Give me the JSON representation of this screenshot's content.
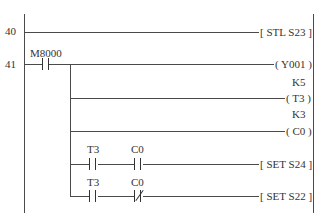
{
  "diagram": {
    "type": "PLC ladder diagram",
    "rungs": [
      {
        "step": "40",
        "elements": [],
        "output": {
          "kind": "instruction",
          "label": "STL  S23"
        }
      },
      {
        "step": "41",
        "input_contact": {
          "label": "M8000",
          "type": "normally-open"
        },
        "branches": [
          {
            "contacts": [],
            "output": {
              "kind": "coil",
              "label": "Y001"
            }
          },
          {
            "contacts": [],
            "output": {
              "kind": "coil",
              "label": "T3",
              "preset": "K5"
            }
          },
          {
            "contacts": [],
            "output": {
              "kind": "coil",
              "label": "C0",
              "preset": "K3"
            }
          },
          {
            "contacts": [
              {
                "label": "T3",
                "type": "normally-open"
              },
              {
                "label": "C0",
                "type": "normally-open"
              }
            ],
            "output": {
              "kind": "instruction",
              "label": "SET  S24"
            }
          },
          {
            "contacts": [
              {
                "label": "T3",
                "type": "normally-open"
              },
              {
                "label": "C0",
                "type": "normally-closed"
              }
            ],
            "output": {
              "kind": "instruction",
              "label": "SET  S22"
            }
          }
        ]
      }
    ]
  },
  "labels": {
    "step40": "40",
    "step41": "41",
    "m8000": "M8000",
    "stl": "[ STL  S23 ]",
    "y001": "( Y001 )",
    "k5": "K5",
    "t3coil": "( T3 )",
    "k3": "K3",
    "c0coil": "( C0 )",
    "t3a": "T3",
    "c0a": "C0",
    "set24": "[ SET  S24 ]",
    "t3b": "T3",
    "c0b": "C0",
    "set22": "[ SET  S22 ]"
  }
}
